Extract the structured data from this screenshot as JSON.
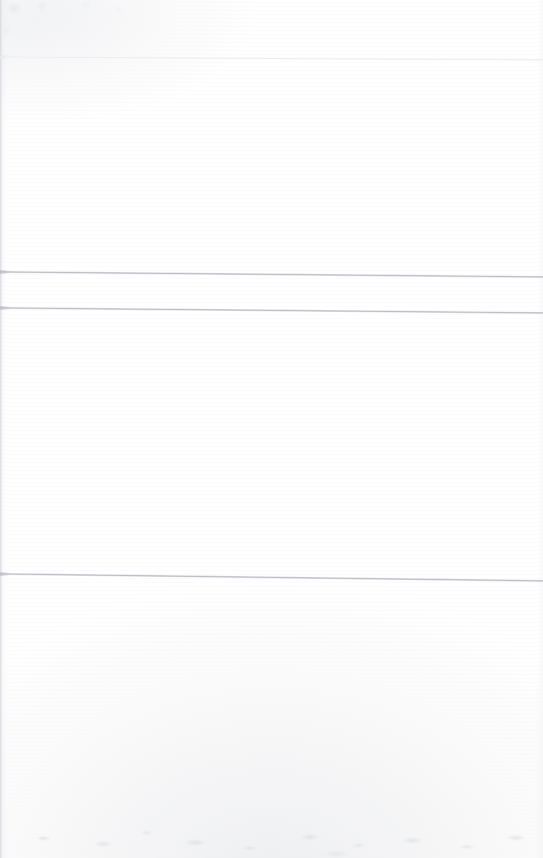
{
  "document": {
    "kind": "scanned-page",
    "page_text": "",
    "visible_text_count": 0,
    "background_color": "#ffffff"
  },
  "rules": [
    {
      "id": "rule-1",
      "name": "horizontal-rule-top",
      "color": "#eceef1",
      "weight": "faint",
      "left_y": 56,
      "right_y": 59,
      "thickness_px": 2
    },
    {
      "id": "rule-2",
      "name": "horizontal-rule-middle-upper",
      "color": "#babdc5",
      "weight": "solid",
      "left_y": 271,
      "right_y": 276,
      "thickness_px": 2
    },
    {
      "id": "rule-3",
      "name": "horizontal-rule-middle-lower",
      "color": "#babdc5",
      "weight": "solid",
      "left_y": 307,
      "right_y": 312,
      "thickness_px": 2
    },
    {
      "id": "rule-4",
      "name": "horizontal-rule-bottom",
      "color": "#babdc5",
      "weight": "solid",
      "left_y": 573,
      "right_y": 580,
      "thickness_px": 2
    }
  ],
  "artifacts": {
    "left_edge_shadow": "#c8cad1",
    "bottom_grain": "#c6c8ce",
    "top_left_smudge": "#d8dae0",
    "scan_streak": "#f3f4f7"
  }
}
